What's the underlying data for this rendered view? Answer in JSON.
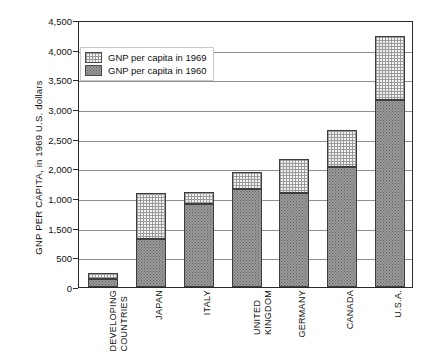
{
  "chart_data": {
    "type": "bar",
    "subtype": "stacked-bar",
    "title": "",
    "xlabel": "",
    "ylabel": "GNP PER CAPITA, in 1969 U.S. dollars",
    "ylim": [
      0,
      4500
    ],
    "ytick_step": 500,
    "ytick_labels": [
      "4,500",
      "4,000",
      "3,500",
      "3,000",
      "2,500",
      "2,000",
      "1,000",
      "1,500",
      "500",
      "0"
    ],
    "ytick_values": [
      4500,
      4000,
      3500,
      3000,
      2500,
      2000,
      1500,
      1000,
      500,
      0
    ],
    "grid": "horizontal",
    "legend_position": "top-left",
    "categories": [
      "DEVELOPING\nCOUNTRIES",
      "JAPAN",
      "ITALY",
      "UNITED\nKINGDOM",
      "GERMANY",
      "CANADA",
      "U.S.A."
    ],
    "series": [
      {
        "name": "GNP per capita in 1960",
        "values": [
          130,
          810,
          1400,
          1650,
          1580,
          2020,
          3160
        ]
      },
      {
        "name": "GNP per capita in 1969",
        "values": [
          230,
          1580,
          1600,
          1940,
          2160,
          2640,
          4230
        ]
      }
    ]
  },
  "legend": {
    "items": [
      {
        "label": "GNP per capita in 1969",
        "swatch": "light-crosshatch"
      },
      {
        "label": "GNP per capita in 1960",
        "swatch": "dark-stipple"
      }
    ]
  },
  "colors": {
    "axis": "#2a2a2a",
    "gridline": "#8e8e8e",
    "segment_1960_fill": "#9b9b9b",
    "segment_1960_dot": "#5e5e5e",
    "segment_1969_fill": "#f2f2f2",
    "segment_1969_line": "#9a9a9a",
    "text": "#111111",
    "background": "#ffffff"
  }
}
